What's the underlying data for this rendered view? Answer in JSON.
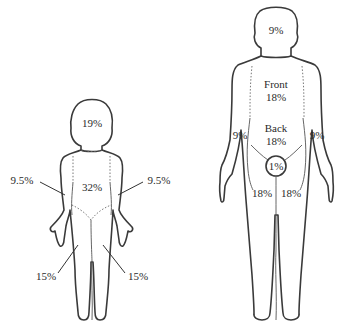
{
  "diagram": {
    "type": "rule-of-nines-body-surface-area",
    "child": {
      "labels": {
        "head": "19%",
        "trunk": "32%",
        "right_arm": "9.5%",
        "left_arm": "9.5%",
        "right_leg": "15%",
        "left_leg": "15%"
      }
    },
    "adult": {
      "labels": {
        "head": "9%",
        "trunk_front_title": "Front",
        "trunk_front_value": "18%",
        "trunk_back_title": "Back",
        "trunk_back_value": "18%",
        "right_arm": "9%",
        "left_arm": "9%",
        "genitals": "1%",
        "right_leg": "18%",
        "left_leg": "18%"
      }
    },
    "colors": {
      "line": "#3a3a3a",
      "text": "#2a2a2a",
      "background": "#ffffff"
    }
  }
}
